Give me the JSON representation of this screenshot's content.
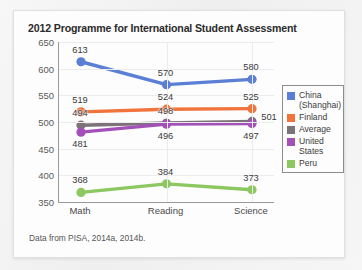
{
  "card": {
    "title": "2012 Programme for International Student Assessment",
    "source_note": "Data from PISA, 2014a, 2014b."
  },
  "legend": {
    "items": [
      {
        "label": "China (Shanghai)",
        "color": "#5b7fd4"
      },
      {
        "label": "Finland",
        "color": "#f0743c"
      },
      {
        "label": "Average",
        "color": "#7d7279"
      },
      {
        "label": "United States",
        "color": "#a350b8"
      },
      {
        "label": "Peru",
        "color": "#8cc75f"
      }
    ]
  },
  "chart_data": {
    "type": "line",
    "title": "2012 Programme for International Student Assessment",
    "xlabel": "",
    "ylabel": "",
    "ylim": [
      350,
      650
    ],
    "yticks": [
      350,
      400,
      450,
      500,
      550,
      600,
      650
    ],
    "grid": true,
    "legend_position": "right",
    "categories": [
      "Math",
      "Reading",
      "Science"
    ],
    "series": [
      {
        "name": "China (Shanghai)",
        "color": "#5b7fd4",
        "values": [
          613,
          570,
          580
        ],
        "label_side": [
          "above",
          "above",
          "above"
        ]
      },
      {
        "name": "Finland",
        "color": "#f0743c",
        "values": [
          519,
          524,
          525
        ],
        "label_side": [
          "above",
          "above",
          "above"
        ]
      },
      {
        "name": "Average",
        "color": "#7d7279",
        "values": [
          494,
          498,
          501
        ],
        "label_side": [
          "above",
          "above",
          "right"
        ]
      },
      {
        "name": "United States",
        "color": "#a350b8",
        "values": [
          481,
          496,
          497
        ],
        "label_side": [
          "below",
          "below",
          "below"
        ]
      },
      {
        "name": "Peru",
        "color": "#8cc75f",
        "values": [
          368,
          384,
          373
        ],
        "label_side": [
          "above",
          "above",
          "above"
        ]
      }
    ],
    "annotation": "Data from PISA, 2014a, 2014b."
  }
}
